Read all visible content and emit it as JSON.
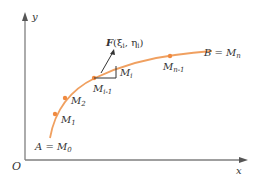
{
  "diagram": {
    "axes": {
      "x_label": "x",
      "y_label": "y",
      "origin_label": "O",
      "axis_color": "#7f7f7f"
    },
    "curve": {
      "color": "#f0a060",
      "start_label": "A = M",
      "start_sub": "0",
      "end_label": "B = M",
      "end_sub": "n"
    },
    "points": [
      {
        "label": "M",
        "sub": "1"
      },
      {
        "label": "M",
        "sub": "2"
      },
      {
        "label": "M",
        "sub": "i-1"
      },
      {
        "label": "M",
        "sub": "i"
      },
      {
        "label": "M",
        "sub": "n-1"
      }
    ],
    "force": {
      "label_bold": "F",
      "label_args": "(ξ",
      "args_sub1": "i",
      "args_mid": ", η",
      "args_sub2": "i",
      "args_close": ")"
    }
  }
}
